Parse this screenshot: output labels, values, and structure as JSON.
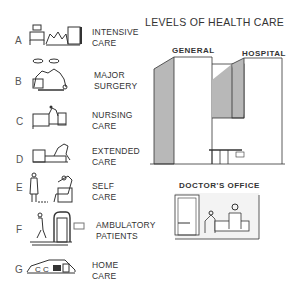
{
  "title": "LEVELS OF HEALTH CARE",
  "levels": [
    {
      "letter": "A",
      "line1": "INTENSIVE",
      "line2": "CARE",
      "icon": "icu-room-illustration"
    },
    {
      "letter": "B",
      "line1": "MAJOR",
      "line2": "SURGERY",
      "icon": "operating-room-illustration"
    },
    {
      "letter": "C",
      "line1": "NURSING",
      "line2": "CARE",
      "icon": "nursing-bed-illustration"
    },
    {
      "letter": "D",
      "line1": "EXTENDED",
      "line2": "CARE",
      "icon": "extended-care-bed-illustration"
    },
    {
      "letter": "E",
      "line1": "SELF",
      "line2": "CARE",
      "icon": "self-care-illustration"
    },
    {
      "letter": "F",
      "line1": "AMBULATORY",
      "line2": "PATIENTS",
      "icon": "ambulatory-entrance-illustration"
    },
    {
      "letter": "G",
      "line1": "HOME",
      "line2": "CARE",
      "icon": "house-illustration"
    }
  ],
  "hospital": {
    "label_left": "GENERAL",
    "label_right": "HOSPITAL"
  },
  "office": {
    "label": "DOCTOR'S OFFICE"
  },
  "colors": {
    "shade": "#b8b8b8",
    "line": "#333333"
  }
}
